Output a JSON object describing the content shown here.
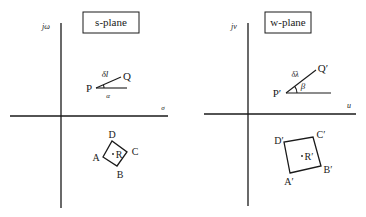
{
  "diagram": {
    "left_panel": {
      "title": "s-plane",
      "vertical_axis_label": "jω",
      "horizontal_axis_label": "σ",
      "point_p": "P",
      "point_q": "Q",
      "segment_label": "δl",
      "angle_label": "α",
      "square_vertices": [
        "A",
        "B",
        "C",
        "D"
      ],
      "center_label": "R"
    },
    "right_panel": {
      "title": "w-plane",
      "vertical_axis_label": "jv",
      "horizontal_axis_label": "u",
      "point_p": "P′",
      "point_q": "Q′",
      "segment_label": "δλ",
      "angle_label": "β",
      "square_vertices": [
        "A′",
        "B′",
        "C′",
        "D′"
      ],
      "center_label": "R′"
    }
  }
}
